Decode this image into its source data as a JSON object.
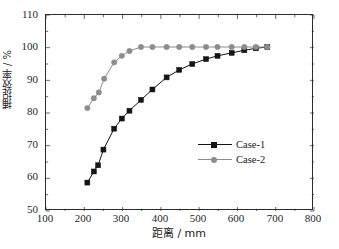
{
  "chart_data": {
    "type": "line",
    "title": "",
    "xlabel": "距离 / mm",
    "ylabel": "捕捉效率 / %",
    "xlim": [
      100,
      800
    ],
    "ylim": [
      50,
      110
    ],
    "xticks": [
      100,
      200,
      300,
      400,
      500,
      600,
      700,
      800
    ],
    "xtick_labels": [
      "100",
      "200",
      "300",
      "400",
      "500",
      "600",
      "700",
      "800"
    ],
    "yticks": [
      50,
      60,
      70,
      80,
      90,
      100,
      110
    ],
    "ytick_labels": [
      "50",
      "60",
      "70",
      "80",
      "90",
      "100",
      "110"
    ],
    "x_minor_tick_step": 50,
    "y_minor_tick_step": 5,
    "grid": false,
    "legend_position": "center-right",
    "frame_color": "#2b2b2b",
    "background": "#ffffff",
    "series": [
      {
        "name": "Case-1",
        "color": "#141414",
        "marker": "square",
        "x": [
          208,
          225,
          236,
          250,
          278,
          298,
          318,
          348,
          378,
          415,
          448,
          482,
          518,
          548,
          585,
          618,
          648,
          678
        ],
        "y": [
          58.7,
          62.1,
          64.0,
          68.8,
          75.2,
          78.3,
          80.7,
          84.0,
          87.2,
          90.9,
          93.2,
          95.0,
          96.5,
          97.5,
          98.4,
          99.2,
          99.8,
          100.2
        ]
      },
      {
        "name": "Case-2",
        "color": "#8c8c8c",
        "marker": "circle",
        "x": [
          208,
          225,
          238,
          252,
          278,
          298,
          318,
          348,
          378,
          415,
          448,
          482,
          518,
          548,
          585,
          618,
          648,
          678
        ],
        "y": [
          81.5,
          84.5,
          86.3,
          90.5,
          95.5,
          97.5,
          99.0,
          100.2,
          100.2,
          100.2,
          100.2,
          100.2,
          100.2,
          100.2,
          100.2,
          100.2,
          100.2,
          100.2
        ]
      }
    ]
  },
  "legend": {
    "items": [
      {
        "label": "Case-1"
      },
      {
        "label": "Case-2"
      }
    ]
  },
  "caption": {
    "text": ""
  }
}
